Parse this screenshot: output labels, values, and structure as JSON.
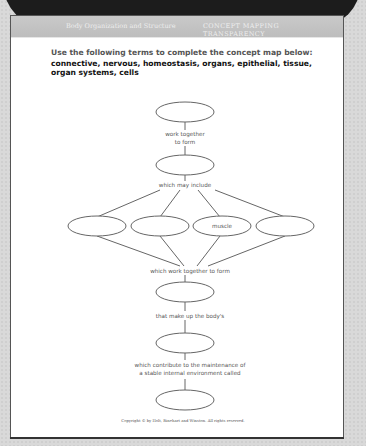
{
  "banner": {
    "title": "TRANSPARENCY"
  },
  "header": {
    "section": "Body Organization and Structure",
    "type": "CONCEPT MAPPING TRANSPARENCY"
  },
  "instructions": {
    "prompt": "Use the following terms to complete the concept map below:",
    "terms": "connective, nervous, homeostasis, organs, epithelial, tissue, organ systems, cells"
  },
  "concept_map": {
    "nodes": [
      {
        "id": "n1",
        "text": ""
      },
      {
        "id": "n2",
        "text": ""
      },
      {
        "id": "n3a",
        "text": ""
      },
      {
        "id": "n3b",
        "text": ""
      },
      {
        "id": "n3c",
        "text": "muscle"
      },
      {
        "id": "n3d",
        "text": ""
      },
      {
        "id": "n4",
        "text": ""
      },
      {
        "id": "n5",
        "text": ""
      },
      {
        "id": "n6",
        "text": ""
      }
    ],
    "links": {
      "l1_line1": "work together",
      "l1_line2": "to form",
      "l2": "which may include",
      "l3": "which work together to form",
      "l4": "that make up the body's",
      "l5_line1": "which contribute to the maintenance of",
      "l5_line2": "a stable internal environment called"
    }
  },
  "footer": {
    "copyright": "Copyright © by Holt, Rinehart and Winston. All rights reserved."
  }
}
